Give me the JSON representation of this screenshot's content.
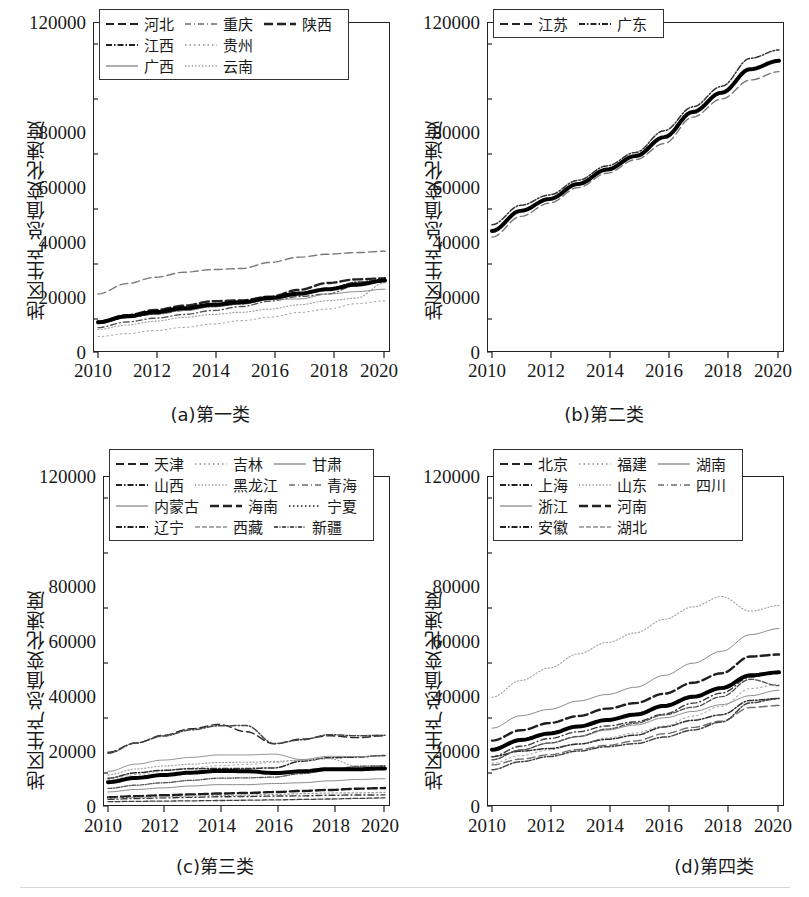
{
  "figure": {
    "axis": {
      "ylabel": "地区生产总值变化速度",
      "yticks": [
        "120000",
        "100000",
        "80000",
        "60000",
        "40000",
        "20000",
        "0"
      ],
      "yticks_shown": [
        "120000",
        "80000",
        "60000",
        "40000",
        "20000",
        "0"
      ],
      "xticks": [
        "2010",
        "2012",
        "2014",
        "2016",
        "2018",
        "2020"
      ],
      "ylim": [
        0,
        120000
      ],
      "xlim": [
        2010,
        2020
      ]
    },
    "panels": [
      {
        "id": "a",
        "caption": "(a)第一类"
      },
      {
        "id": "b",
        "caption": "(b)第二类"
      },
      {
        "id": "c",
        "caption": "(c)第三类"
      },
      {
        "id": "d",
        "caption": "(d)第四类"
      }
    ]
  },
  "chart_data": [
    {
      "type": "line",
      "panel": "a",
      "title": "(a)第一类",
      "xlabel": "",
      "ylabel": "地区生产总值变化速度",
      "x": [
        2010,
        2011,
        2012,
        2013,
        2014,
        2015,
        2016,
        2017,
        2018,
        2019,
        2020
      ],
      "xlim": [
        2010,
        2020
      ],
      "ylim": [
        0,
        120000
      ],
      "grid": false,
      "legend_position": "upper-left",
      "legend_columns": 3,
      "series": [
        {
          "name": "河北",
          "dash": "dashed",
          "color": "#7a7a7a",
          "values": [
            20394,
            24228,
            26575,
            28443,
            29421,
            29806,
            32071,
            34016,
            35105,
            35705,
            36207
          ]
        },
        {
          "name": "重庆",
          "dash": "dash-dot-fine",
          "color": "#555555",
          "values": [
            7926,
            10011,
            11410,
            12783,
            14263,
            15717,
            17741,
            19425,
            20363,
            23606,
            25003
          ]
        },
        {
          "name": "陕西",
          "dash": "dashed-thick",
          "color": "#222222",
          "values": [
            10123,
            12512,
            14454,
            16045,
            17690,
            18022,
            19400,
            21899,
            24438,
            25793,
            26182
          ]
        },
        {
          "name": "江西",
          "dash": "dash-dot",
          "color": "#333333",
          "values": [
            9451,
            11703,
            12949,
            14338,
            15715,
            16724,
            18364,
            20006,
            21985,
            24758,
            25692
          ]
        },
        {
          "name": "贵州",
          "dash": "dotted-light",
          "color": "#aaaaaa",
          "values": [
            4602,
            5702,
            6852,
            8007,
            9266,
            10503,
            11777,
            13541,
            14807,
            16769,
            17827
          ]
        },
        {
          "name": "广西",
          "dash": "solid",
          "color": "#8a8a8a",
          "values": [
            9570,
            11721,
            13035,
            14378,
            15673,
            16803,
            18317,
            18523,
            20353,
            21237,
            22157
          ]
        },
        {
          "name": "云南",
          "dash": "dotted-fine",
          "color": "#9b9b9b",
          "values": [
            7224,
            8893,
            10309,
            11721,
            12815,
            13619,
            14788,
            16376,
            17881,
            18858,
            24521
          ]
        }
      ]
    },
    {
      "type": "line",
      "panel": "b",
      "title": "(b)第二类",
      "xlabel": "",
      "ylabel": "地区生产总值变化速度",
      "x": [
        2010,
        2011,
        2012,
        2013,
        2014,
        2015,
        2016,
        2017,
        2018,
        2019,
        2020
      ],
      "xlim": [
        2010,
        2020
      ],
      "ylim": [
        0,
        120000
      ],
      "grid": false,
      "legend_position": "upper-left",
      "legend_columns": 2,
      "series": [
        {
          "name": "江苏",
          "dash": "dashed",
          "color": "#777777",
          "values": [
            41425,
            49110,
            54058,
            59753,
            65088,
            70116,
            76086,
            85900,
            92595,
            99632,
            102719
          ]
        },
        {
          "name": "广东",
          "dash": "dash-dot",
          "color": "#333333",
          "values": [
            46013,
            53210,
            57068,
            62475,
            67810,
            72813,
            80855,
            89705,
            97278,
            107671,
            110761
          ]
        }
      ]
    },
    {
      "type": "line",
      "panel": "c",
      "title": "(c)第三类",
      "xlabel": "",
      "ylabel": "地区生产总值变化速度",
      "x": [
        2010,
        2011,
        2012,
        2013,
        2014,
        2015,
        2016,
        2017,
        2018,
        2019,
        2020
      ],
      "xlim": [
        2010,
        2020
      ],
      "ylim": [
        0,
        120000
      ],
      "grid": false,
      "legend_position": "upper-left",
      "legend_columns": 3,
      "series": [
        {
          "name": "天津",
          "dash": "dashed",
          "color": "#2b2b2b",
          "values": [
            18800,
            22200,
            25100,
            27500,
            29100,
            26400,
            21900,
            23700,
            24900,
            24200,
            24900
          ]
        },
        {
          "name": "吉林",
          "dash": "dotted-light",
          "color": "#b0b0b0",
          "values": [
            8700,
            10500,
            11900,
            13000,
            13800,
            14300,
            15000,
            15900,
            16500,
            17100,
            17700
          ]
        },
        {
          "name": "甘肃",
          "dash": "solid",
          "color": "#8a8a8a",
          "values": [
            4100,
            5000,
            5600,
            6300,
            6800,
            6800,
            7200,
            7500,
            8200,
            8700,
            9000
          ]
        },
        {
          "name": "山西",
          "dash": "dash-dot",
          "color": "#2f2f2f",
          "values": [
            9200,
            11200,
            12100,
            12700,
            12800,
            12800,
            13000,
            15500,
            16800,
            17000,
            17600
          ]
        },
        {
          "name": "黑龙江",
          "dash": "dotted-fine",
          "color": "#9a9a9a",
          "values": [
            10400,
            12600,
            13700,
            14400,
            15000,
            15100,
            15400,
            15900,
            16400,
            13600,
            13700
          ]
        },
        {
          "name": "青海",
          "dash": "dash-dot-fine",
          "color": "#3a3a3a",
          "values": [
            1350,
            1670,
            1890,
            2100,
            2300,
            2420,
            2570,
            2640,
            2870,
            2970,
            3000
          ]
        },
        {
          "name": "内蒙古",
          "dash": "solid-thin",
          "color": "#888888",
          "values": [
            11700,
            14400,
            15900,
            16900,
            17800,
            17800,
            18100,
            16100,
            17300,
            17200,
            17400
          ]
        },
        {
          "name": "海南",
          "dash": "dashed-thick",
          "color": "#1c1c1c",
          "values": [
            2100,
            2520,
            2860,
            3180,
            3500,
            3700,
            4050,
            4460,
            4830,
            5300,
            5530
          ]
        },
        {
          "name": "宁夏",
          "dash": "dotted",
          "color": "#999999",
          "values": [
            1690,
            2100,
            2340,
            2570,
            2750,
            2910,
            3150,
            3440,
            3700,
            3750,
            3920
          ]
        },
        {
          "name": "辽宁",
          "dash": "dash-dot",
          "color": "#444444",
          "values": [
            18400,
            22200,
            24800,
            27100,
            28600,
            28700,
            22000,
            23400,
            25300,
            24900,
            25100
          ]
        },
        {
          "name": "西藏",
          "dash": "dash-fine",
          "color": "#3f3f3f",
          "values": [
            510,
            610,
            700,
            810,
            920,
            1030,
            1150,
            1310,
            1480,
            1700,
            1900
          ]
        },
        {
          "name": "新疆",
          "dash": "dash-dot-dense",
          "color": "#555555",
          "values": [
            5400,
            6600,
            7500,
            8400,
            9200,
            9300,
            9600,
            10900,
            12200,
            13600,
            13800
          ]
        }
      ]
    },
    {
      "type": "line",
      "panel": "d",
      "title": "(d)第四类",
      "xlabel": "",
      "ylabel": "地区生产总值变化速度",
      "x": [
        2010,
        2011,
        2012,
        2013,
        2014,
        2015,
        2016,
        2017,
        2018,
        2019,
        2020
      ],
      "xlim": [
        2010,
        2020
      ],
      "ylim": [
        0,
        120000
      ],
      "grid": false,
      "legend_position": "upper-left",
      "legend_columns": 3,
      "series": [
        {
          "name": "北京",
          "dash": "dashed",
          "color": "#6f6f6f",
          "values": [
            14114,
            16252,
            17879,
            19801,
            21331,
            23015,
            25669,
            28015,
            30320,
            35371,
            36103
          ]
        },
        {
          "name": "福建",
          "dash": "dotted-light",
          "color": "#a8a8a8",
          "values": [
            14737,
            17560,
            19702,
            21868,
            24055,
            25980,
            28519,
            32182,
            35804,
            42395,
            43904
          ]
        },
        {
          "name": "湖南",
          "dash": "solid",
          "color": "#8d8d8d",
          "values": [
            16038,
            19670,
            22154,
            24502,
            27037,
            28902,
            31551,
            33903,
            36426,
            39752,
            41781
          ]
        },
        {
          "name": "上海",
          "dash": "dash-dot",
          "color": "#303030",
          "values": [
            17166,
            19196,
            20182,
            21818,
            23568,
            25123,
            28179,
            30633,
            32680,
            37987,
            38700
          ]
        },
        {
          "name": "山东",
          "dash": "dotted-fine",
          "color": "#9e9e9e",
          "values": [
            39170,
            45362,
            50013,
            55230,
            59427,
            63002,
            68024,
            72634,
            76470,
            71067,
            73129
          ]
        },
        {
          "name": "四川",
          "dash": "dash-dot-fine",
          "color": "#3b3b3b",
          "values": [
            17185,
            21027,
            23872,
            26392,
            28537,
            30053,
            32935,
            36980,
            40678,
            46616,
            48599
          ]
        },
        {
          "name": "浙江",
          "dash": "solid-thin",
          "color": "#7d7d7d",
          "values": [
            27722,
            32319,
            34665,
            37757,
            40173,
            42886,
            47251,
            51768,
            56197,
            62352,
            64613
          ]
        },
        {
          "name": "河南",
          "dash": "dashed-thick",
          "color": "#1f1f1f",
          "values": [
            23092,
            26931,
            29599,
            32191,
            34939,
            37002,
            40472,
            44553,
            48056,
            54259,
            54997
          ]
        },
        {
          "name": "安徽",
          "dash": "dash-dot",
          "color": "#434343",
          "values": [
            12359,
            15301,
            17212,
            19229,
            20849,
            22006,
            24408,
            27018,
            30007,
            37114,
            38681
          ]
        },
        {
          "name": "湖北",
          "dash": "dash-fine",
          "color": "#505050",
          "values": [
            15968,
            19632,
            22250,
            24668,
            27379,
            29550,
            32665,
            35478,
            39367,
            45828,
            43443
          ]
        }
      ]
    }
  ],
  "legends": {
    "a": {
      "columns": 3,
      "rows": [
        [
          {
            "label": "河北",
            "key": "dashed"
          },
          {
            "label": "重庆",
            "key": "dash-dot-fine"
          },
          {
            "label": "陕西",
            "key": "dashed-thick"
          }
        ],
        [
          {
            "label": "江西",
            "key": "dash-dot"
          },
          {
            "label": "贵州",
            "key": "dotted-light"
          },
          null
        ],
        [
          {
            "label": "广西",
            "key": "solid"
          },
          {
            "label": "云南",
            "key": "dotted-fine"
          },
          null
        ]
      ]
    },
    "b": {
      "columns": 2,
      "rows": [
        [
          {
            "label": "江苏",
            "key": "dashed"
          },
          {
            "label": "广东",
            "key": "dash-dot"
          }
        ]
      ]
    },
    "c": {
      "columns": 3,
      "rows": [
        [
          {
            "label": "天津",
            "key": "dashed"
          },
          {
            "label": "吉林",
            "key": "dotted-light"
          },
          {
            "label": "甘肃",
            "key": "solid"
          }
        ],
        [
          {
            "label": "山西",
            "key": "dash-dot"
          },
          {
            "label": "黑龙江",
            "key": "dotted-fine"
          },
          {
            "label": "青海",
            "key": "dash-dot-fine"
          }
        ],
        [
          {
            "label": "内蒙古",
            "key": "solid-thin"
          },
          {
            "label": "海南",
            "key": "dashed-thick"
          },
          {
            "label": "宁夏",
            "key": "dotted"
          }
        ],
        [
          {
            "label": "辽宁",
            "key": "dash-dot"
          },
          {
            "label": "西藏",
            "key": "dash-fine"
          },
          {
            "label": "新疆",
            "key": "dash-dot-dense"
          }
        ]
      ]
    },
    "d": {
      "columns": 3,
      "rows": [
        [
          {
            "label": "北京",
            "key": "dashed"
          },
          {
            "label": "福建",
            "key": "dotted-light"
          },
          {
            "label": "湖南",
            "key": "solid"
          }
        ],
        [
          {
            "label": "上海",
            "key": "dash-dot"
          },
          {
            "label": "山东",
            "key": "dotted-fine"
          },
          {
            "label": "四川",
            "key": "dash-dot-fine"
          }
        ],
        [
          {
            "label": "浙江",
            "key": "solid-thin"
          },
          {
            "label": "河南",
            "key": "dashed-thick"
          },
          null
        ],
        [
          {
            "label": "安徽",
            "key": "dash-dot"
          },
          {
            "label": "湖北",
            "key": "dash-fine"
          },
          null
        ]
      ]
    }
  }
}
